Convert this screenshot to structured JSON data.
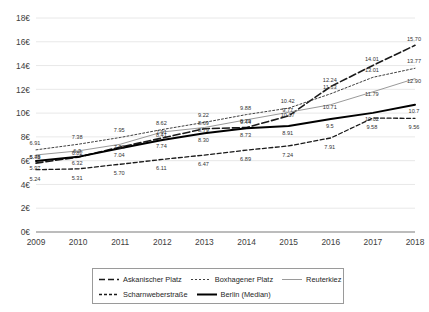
{
  "chart_data": {
    "type": "line",
    "title": "",
    "subtitle": "",
    "xlabel": "",
    "ylabel": "",
    "x": [
      "2009",
      "2010",
      "2011",
      "2012",
      "2013",
      "2014",
      "2015",
      "2016",
      "2017",
      "2018"
    ],
    "categories": [
      "2009",
      "2010",
      "2011",
      "2012",
      "2013",
      "2014",
      "2015",
      "2016",
      "2017",
      "2018"
    ],
    "ylim": [
      0,
      18
    ],
    "ytick_values": [
      0,
      2,
      4,
      6,
      8,
      10,
      12,
      14,
      16,
      18
    ],
    "ytick_labels": [
      "0€",
      "2€",
      "4€",
      "6€",
      "8€",
      "10€",
      "12€",
      "14€",
      "16€",
      "18€"
    ],
    "grid": true,
    "grid_axis": "y",
    "legend_position": "bottom",
    "currency_symbol": "€",
    "series": [
      {
        "name": "Askanischer Platz",
        "style": "dashed",
        "color": "#1a1a1a",
        "width": 1.6,
        "values": [
          5.79,
          6.3,
          7.14,
          7.91,
          8.69,
          8.79,
          9.77,
          12.24,
          14.01,
          15.7
        ],
        "labels": [
          "5.79",
          "6.3",
          "7.14",
          "7.91",
          "8.69",
          "8.79",
          "9.77",
          "12.24",
          "14.01",
          "15.70"
        ]
      },
      {
        "name": "Boxhagener Platz",
        "style": "dotted",
        "color": "#404040",
        "width": 1.0,
        "values": [
          6.91,
          7.38,
          7.95,
          8.62,
          9.22,
          9.88,
          10.42,
          11.63,
          13.01,
          13.77
        ],
        "labels": [
          "6.91",
          "7.38",
          "7.95",
          "8.62",
          "9.22",
          "9.88",
          "10.42",
          "11.63",
          "13.01",
          "13.77"
        ]
      },
      {
        "name": "Reuterkiez",
        "style": "solid-thin",
        "color": "#9a9a9a",
        "width": 1.0,
        "values": [
          6.48,
          6.82,
          7.38,
          8.41,
          8.79,
          9.44,
          10.07,
          10.71,
          11.79,
          12.9
        ],
        "labels": [
          "6.48",
          "6.82",
          "7.38",
          "8.41",
          "8.79",
          "9.44",
          "10.07",
          "10.71",
          "11.79",
          "12.90"
        ]
      },
      {
        "name": "Scharnweberstraße",
        "style": "fine-dashed",
        "color": "#1a1a1a",
        "width": 1.3,
        "values": [
          5.24,
          5.31,
          5.7,
          6.11,
          6.47,
          6.89,
          7.24,
          7.91,
          9.58,
          9.56
        ],
        "labels": [
          "5.24",
          "5.31",
          "5.70",
          "6.11",
          "6.47",
          "6.89",
          "7.24",
          "7.91",
          "9.58",
          "9.56"
        ]
      },
      {
        "name": "Berlin (Median)",
        "style": "solid-thick",
        "color": "#000000",
        "width": 2.0,
        "values": [
          5.97,
          6.32,
          7.04,
          7.74,
          8.3,
          8.73,
          8.91,
          9.5,
          10.02,
          10.7
        ],
        "labels": [
          "5.97",
          "6.32",
          "7.04",
          "7.74",
          "8.30",
          "8.73",
          "8.91",
          "9.5",
          "10.02",
          "10.7"
        ]
      }
    ],
    "visible_point_labels": [
      {
        "year": "2009",
        "texts": [
          "6.91",
          "6.48",
          "5.79",
          "5.24"
        ]
      },
      {
        "year": "2010",
        "texts": [
          "7.38",
          "6.82",
          "6.3",
          "5.31"
        ]
      },
      {
        "year": "2011",
        "texts": [
          "7.95",
          "7.14",
          "5.70"
        ]
      },
      {
        "year": "2012",
        "texts": [
          "8.62",
          "8.41",
          "7.91",
          "6.11"
        ]
      },
      {
        "year": "2013",
        "texts": [
          "9.22",
          "8.79",
          "8.69",
          "6.47"
        ]
      },
      {
        "year": "2014",
        "texts": [
          "9.88",
          "9.44",
          "8.79",
          "6.89"
        ]
      },
      {
        "year": "2015",
        "texts": [
          "10.42",
          "10.07",
          "9.77",
          "8.91",
          "7.24"
        ]
      },
      {
        "year": "2016",
        "texts": [
          "12.24",
          "11.63",
          "10.71",
          "9.5",
          "7.91"
        ]
      },
      {
        "year": "2017",
        "texts": [
          "14.01",
          "13.01",
          "11.79",
          "10.02",
          "9.58"
        ]
      },
      {
        "year": "2018",
        "texts": [
          "15.70",
          "13.77",
          "12.90",
          "10.7",
          "9.56"
        ]
      }
    ]
  },
  "legend": {
    "rows": [
      [
        {
          "label": "Askanischer Platz",
          "style": "dashed"
        },
        {
          "label": "Boxhagener Platz",
          "style": "dotted"
        },
        {
          "label": "Reuterkiez",
          "style": "solid-thin"
        }
      ],
      [
        {
          "label": "Scharnweberstraße",
          "style": "fine-dashed"
        },
        {
          "label": "Berlin (Median)",
          "style": "solid-thick"
        }
      ]
    ]
  },
  "colors": {
    "axis": "#a6a6a6",
    "grid": "#e2e2e2",
    "tick_text": "#404040",
    "label_text": "#333333",
    "background": "#ffffff"
  }
}
